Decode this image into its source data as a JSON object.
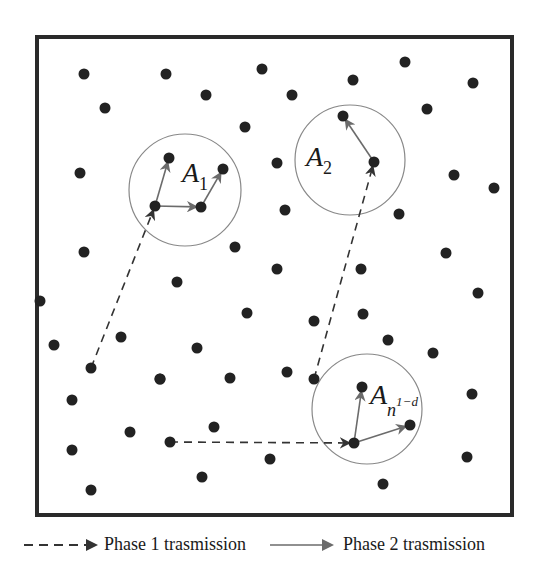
{
  "diagram": {
    "title": "",
    "frame": {
      "x": 37,
      "y": 37,
      "width": 475,
      "height": 478,
      "stroke": "#2a2a2a"
    },
    "node_color": "#222222",
    "circle_color": "#888888",
    "phase1_color": "#333333",
    "phase2_color": "#6b6b6b",
    "nodes": [
      [
        84,
        74
      ],
      [
        166,
        74
      ],
      [
        262,
        69
      ],
      [
        105,
        108
      ],
      [
        206,
        95
      ],
      [
        245,
        127
      ],
      [
        80,
        173
      ],
      [
        84,
        252
      ],
      [
        235,
        247
      ],
      [
        405,
        62
      ],
      [
        353,
        80
      ],
      [
        292,
        95
      ],
      [
        473,
        83
      ],
      [
        427,
        109
      ],
      [
        277,
        163
      ],
      [
        454,
        175
      ],
      [
        494,
        188
      ],
      [
        285,
        210
      ],
      [
        399,
        214
      ],
      [
        446,
        253
      ],
      [
        277,
        269
      ],
      [
        361,
        269
      ],
      [
        177,
        282
      ],
      [
        54,
        345
      ],
      [
        121,
        337
      ],
      [
        91,
        368
      ],
      [
        160,
        379
      ],
      [
        72,
        400
      ],
      [
        130,
        432
      ],
      [
        214,
        427
      ],
      [
        72,
        450
      ],
      [
        170,
        442
      ],
      [
        91,
        490
      ],
      [
        202,
        477
      ],
      [
        270,
        459
      ],
      [
        247,
        313
      ],
      [
        197,
        348
      ],
      [
        478,
        293
      ],
      [
        314,
        321
      ],
      [
        363,
        314
      ],
      [
        388,
        340
      ],
      [
        433,
        353
      ],
      [
        472,
        394
      ],
      [
        467,
        457
      ],
      [
        383,
        484
      ],
      [
        314,
        379
      ],
      [
        230,
        378
      ],
      [
        287,
        372
      ],
      [
        160,
        379
      ],
      [
        40,
        301
      ]
    ],
    "clusters": [
      {
        "label": "A",
        "subscript": "1",
        "superscript": "",
        "center": [
          185,
          190
        ],
        "radius": 56,
        "label_pos": [
          182,
          168
        ],
        "hub": [
          155,
          206
        ],
        "members": [
          [
            169,
            158
          ],
          [
            201,
            207
          ],
          [
            223,
            169
          ]
        ],
        "phase2_edges": [
          [
            [
              155,
              206
            ],
            [
              169,
              158
            ]
          ],
          [
            [
              155,
              206
            ],
            [
              201,
              207
            ]
          ],
          [
            [
              201,
              207
            ],
            [
              223,
              169
            ]
          ]
        ]
      },
      {
        "label": "A",
        "subscript": "2",
        "superscript": "",
        "center": [
          350,
          160
        ],
        "radius": 55,
        "label_pos": [
          306,
          152
        ],
        "hub": [
          374,
          162
        ],
        "members": [
          [
            343,
            116
          ]
        ],
        "phase2_edges": [
          [
            [
              374,
              162
            ],
            [
              343,
              116
            ]
          ]
        ]
      },
      {
        "label": "A",
        "subscript": "n",
        "superscript": "1−d",
        "center": [
          367,
          409
        ],
        "radius": 55,
        "label_pos": [
          370,
          390
        ],
        "hub": [
          354,
          443
        ],
        "members": [
          [
            362,
            387
          ],
          [
            410,
            425
          ]
        ],
        "phase2_edges": [
          [
            [
              354,
              443
            ],
            [
              362,
              387
            ]
          ],
          [
            [
              354,
              443
            ],
            [
              410,
              425
            ]
          ]
        ]
      }
    ],
    "phase1_edges": [
      [
        [
          91,
          368
        ],
        [
          155,
          206
        ]
      ],
      [
        [
          314,
          379
        ],
        [
          374,
          162
        ]
      ],
      [
        [
          170,
          442
        ],
        [
          354,
          443
        ]
      ]
    ]
  },
  "legend": {
    "phase1_label": "Phase 1 trasmission",
    "phase2_label": "Phase 2 trasmission"
  }
}
